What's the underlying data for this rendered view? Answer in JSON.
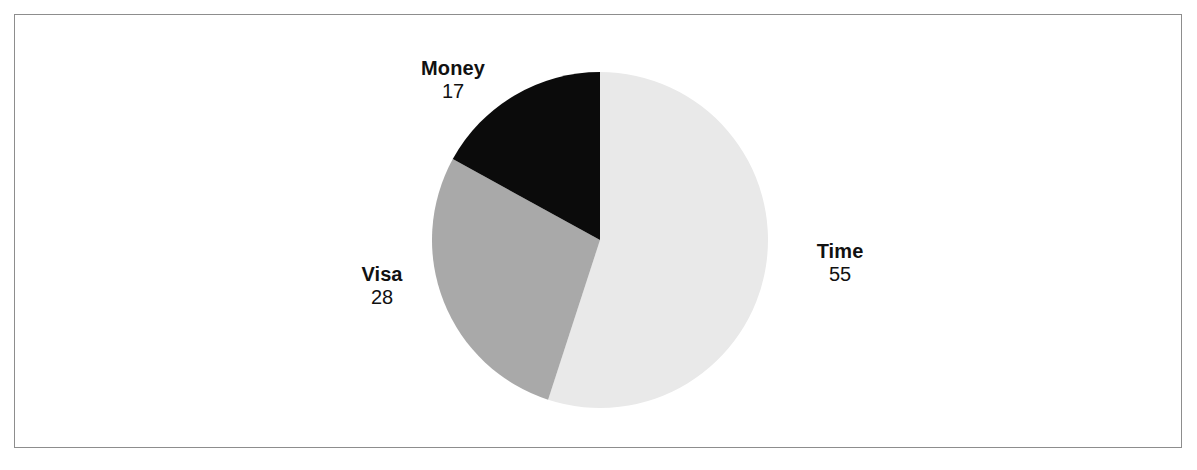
{
  "figure": {
    "background_color": "#ffffff",
    "border_color": "#8d8d8d",
    "width": 1197,
    "height": 470
  },
  "chart_data": {
    "type": "pie",
    "title": "",
    "subtitle": "",
    "xlabel": "",
    "ylabel": "",
    "grid": false,
    "legend_position": "none",
    "label_style": "name-above-value",
    "start_angle_deg": 0,
    "direction": "clockwise",
    "total": 100,
    "categories": [
      "Time",
      "Visa",
      "Money"
    ],
    "values": [
      55,
      28,
      17
    ],
    "colors": [
      "#e9e9e9",
      "#a9a9a9",
      "#0b0b0b"
    ],
    "slices": [
      {
        "label": "Time",
        "value": 55,
        "value_text": "55",
        "color": "#e9e9e9",
        "percent": 55,
        "start_angle_deg": 0,
        "end_angle_deg": 198
      },
      {
        "label": "Visa",
        "value": 28,
        "value_text": "28",
        "color": "#a9a9a9",
        "percent": 28,
        "start_angle_deg": 198,
        "end_angle_deg": 298.8
      },
      {
        "label": "Money",
        "value": 17,
        "value_text": "17",
        "color": "#0b0b0b",
        "percent": 17,
        "start_angle_deg": 298.8,
        "end_angle_deg": 360
      }
    ],
    "geometry": {
      "center_x": 600,
      "center_y": 240,
      "radius": 168
    }
  }
}
